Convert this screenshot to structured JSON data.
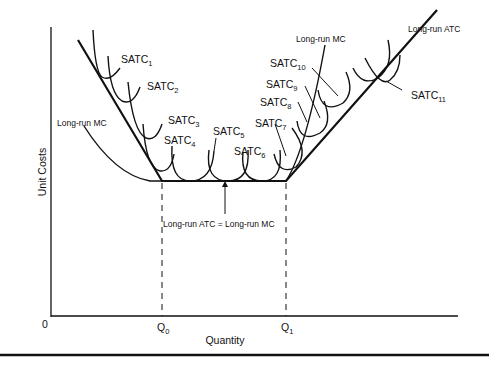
{
  "diagram": {
    "type": "economics-cost-curves",
    "title": "",
    "axes": {
      "x_label": "Quantity",
      "y_label": "Unit Costs",
      "origin_label": "0",
      "x_ticks": [
        {
          "base": "Q",
          "sub": "0"
        },
        {
          "base": "Q",
          "sub": "1"
        }
      ]
    },
    "curves": {
      "long_run_atc": "Long-run ATC",
      "long_run_mc_left": "Long-run MC",
      "long_run_mc_right": "Long-run MC",
      "equality_label": "Long-run ATC = Long-run MC"
    },
    "satc_labels": [
      {
        "base": "SATC",
        "sub": "1"
      },
      {
        "base": "SATC",
        "sub": "2"
      },
      {
        "base": "SATC",
        "sub": "3"
      },
      {
        "base": "SATC",
        "sub": "4"
      },
      {
        "base": "SATC",
        "sub": "5"
      },
      {
        "base": "SATC",
        "sub": "6"
      },
      {
        "base": "SATC",
        "sub": "7"
      },
      {
        "base": "SATC",
        "sub": "8"
      },
      {
        "base": "SATC",
        "sub": "9"
      },
      {
        "base": "SATC",
        "sub": "10"
      },
      {
        "base": "SATC",
        "sub": "11"
      }
    ],
    "colors": {
      "line": "#111111",
      "background": "#ffffff"
    }
  }
}
